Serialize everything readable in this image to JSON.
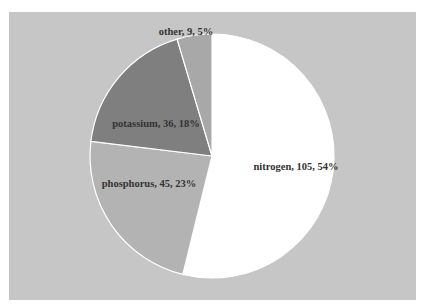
{
  "chart_data": {
    "type": "pie",
    "title": "",
    "categories": [
      "nitrogen",
      "phosphorus",
      "potassium",
      "other"
    ],
    "values": [
      105,
      45,
      36,
      9
    ],
    "percentages": [
      54,
      23,
      18,
      5
    ],
    "labels": [
      "nitrogen, 105, 54%",
      "phosphorus, 45, 23%",
      "potassium, 36, 18%",
      "other, 9, 5%"
    ],
    "colors": [
      "#ffffff",
      "#b3b3b3",
      "#7f7f7f",
      "#a8a8a8"
    ],
    "start_angle": "12 o'clock",
    "direction": "clockwise",
    "legend": "none",
    "background": "#c6c6c6"
  }
}
